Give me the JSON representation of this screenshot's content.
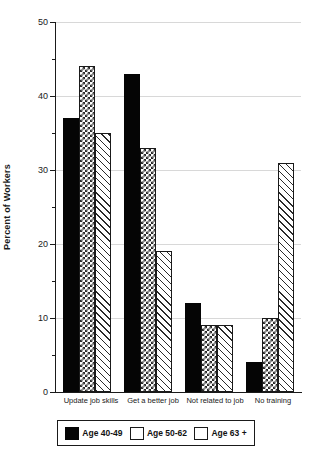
{
  "chart_data": {
    "type": "bar",
    "title": "",
    "xlabel": "",
    "ylabel": "Percent of Workers",
    "ylim": [
      0,
      50
    ],
    "ytick_labels": [
      "0",
      "10",
      "20",
      "30",
      "40",
      "50"
    ],
    "ytick_values": [
      0,
      10,
      20,
      30,
      40,
      50
    ],
    "minor_tick_values": [
      5,
      15,
      25,
      35,
      45
    ],
    "grid": "horizontal-major",
    "legend_position": "bottom",
    "categories": [
      "Update job skills",
      "Get a better job",
      "Not related to job",
      "No training"
    ],
    "series": [
      {
        "name": "Age 40-49",
        "pattern": "solid-black",
        "values": [
          37,
          43,
          12,
          4
        ]
      },
      {
        "name": "Age 50-62",
        "pattern": "checkerboard",
        "values": [
          44,
          33,
          9,
          10
        ]
      },
      {
        "name": "Age 63 +",
        "pattern": "diagonal-hatch",
        "values": [
          35,
          19,
          9,
          31
        ]
      }
    ]
  },
  "colors": {
    "axis": "#1a1a1a",
    "grid": "#d8d8d8",
    "bar_outline": "#1a1a1a",
    "series_1_fill": "#050505",
    "background": "#ffffff"
  },
  "artifacts": {
    "top_cropped_text": ""
  }
}
